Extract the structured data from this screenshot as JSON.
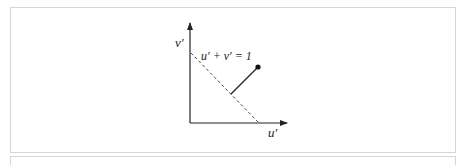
{
  "figure": {
    "y_axis_label": "v′",
    "x_axis_label": "u′",
    "line_label": "u′ + v′ = 1",
    "point": {
      "x": 258,
      "y": 67
    },
    "projection_foot": {
      "x": 231,
      "y": 94
    },
    "colors": {
      "axis": "#222222",
      "dashed": "#333333",
      "border": "#d6d6d6"
    }
  }
}
